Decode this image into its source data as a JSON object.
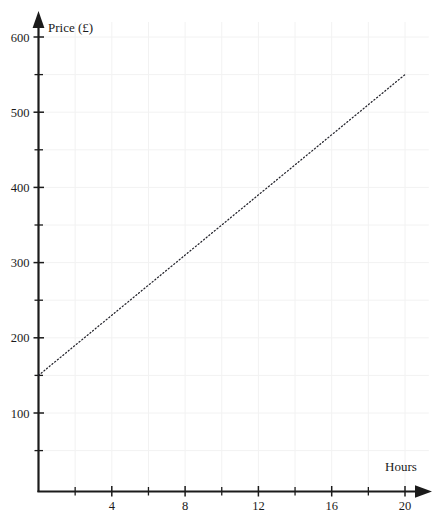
{
  "chart_data": {
    "type": "line",
    "title": "",
    "xlabel": "Hours",
    "ylabel": "Price (£)",
    "xlim": [
      0,
      21.5
    ],
    "ylim": [
      0,
      630
    ],
    "grid": true,
    "legend": "none",
    "line_style": "dotted",
    "series": [
      {
        "name": "Price",
        "x": [
          0,
          20
        ],
        "values": [
          150,
          550
        ],
        "intercept": 150,
        "slope_per_hour": 20
      }
    ],
    "x_ticks_major": [
      4,
      8,
      12,
      16,
      20
    ],
    "x_tick_labels": [
      "4",
      "8",
      "12",
      "16",
      "20"
    ],
    "x_ticks_minor": [
      2,
      6,
      10,
      14,
      18
    ],
    "y_ticks_major": [
      100,
      200,
      300,
      400,
      500,
      600
    ],
    "y_tick_labels": [
      "100",
      "200",
      "300",
      "400",
      "500",
      "600"
    ],
    "y_ticks_minor": [
      50,
      150,
      250,
      350,
      450,
      550
    ],
    "colors": {
      "axis": "#1b1b1b",
      "line": "#23232b",
      "grid": "#f2f2f2",
      "background": "#ffffff",
      "text": "#1a1a1a"
    }
  },
  "axes": {
    "y_axis_title": "Price (£)",
    "x_axis_title": "Hours"
  },
  "y_labels": [
    {
      "value": 600,
      "text": "600"
    },
    {
      "value": 500,
      "text": "500"
    },
    {
      "value": 400,
      "text": "400"
    },
    {
      "value": 300,
      "text": "300"
    },
    {
      "value": 200,
      "text": "200"
    },
    {
      "value": 100,
      "text": "100"
    }
  ],
  "x_labels": [
    {
      "value": 4,
      "text": "4"
    },
    {
      "value": 8,
      "text": "8"
    },
    {
      "value": 12,
      "text": "12"
    },
    {
      "value": 16,
      "text": "16"
    },
    {
      "value": 20,
      "text": "20"
    }
  ]
}
